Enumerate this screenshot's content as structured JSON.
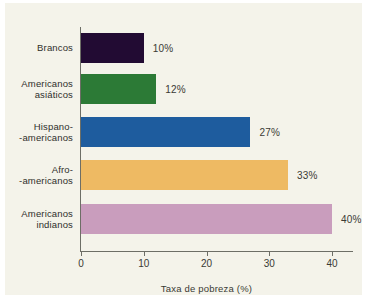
{
  "chart_data": {
    "type": "bar",
    "orientation": "horizontal",
    "title": "",
    "xlabel": "Taxa de pobreza (%)",
    "ylabel": "",
    "categories": [
      "Brancos",
      "Americanos\nasiáticos",
      "Hispano-\n-americanos",
      "Afro-\n-americanos",
      "Americanos\nindianos"
    ],
    "values": [
      10,
      12,
      27,
      33,
      40
    ],
    "value_labels": [
      "10%",
      "12%",
      "27%",
      "33%",
      "40%"
    ],
    "colors": [
      "#220b33",
      "#2c7a36",
      "#1e5c9e",
      "#eeba63",
      "#c99dbd"
    ],
    "xlim": [
      0,
      40
    ],
    "xticks": [
      0,
      10,
      20,
      30,
      40
    ],
    "xtick_labels": [
      "0",
      "10",
      "20",
      "30",
      "40"
    ],
    "grid": false,
    "legend": "none",
    "background": "#f4f3ea",
    "axis_color": "#6d6e66",
    "text_color": "#2f2f2b"
  }
}
